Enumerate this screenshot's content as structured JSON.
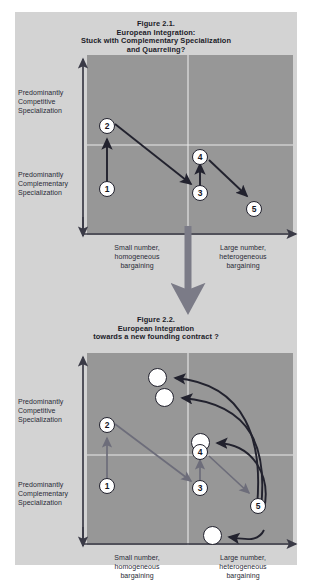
{
  "page": {
    "background": "#ffffff",
    "card_background": "#d3d3d3",
    "plot_background": "#979797",
    "ink_color": "#22222e",
    "muted_arrow_color": "#6d6d7a",
    "node_fill": "#ffffff",
    "divider_color": "#e8e8e8"
  },
  "figure1": {
    "title": {
      "line1": "Figure 2.1.",
      "line2": "European Integration:",
      "line3": "Stuck with Complementary Specialization",
      "line4": "and Quarreling?"
    },
    "y_axis": {
      "upper": {
        "line1": "Predominantly",
        "line2": "Competitive",
        "line3": "Specialization"
      },
      "lower": {
        "line1": "Predominantly",
        "line2": "Complementary",
        "line3": "Specialization"
      }
    },
    "x_axis": {
      "left": {
        "line1": "Small number,",
        "line2": "homogeneous",
        "line3": "bargaining"
      },
      "right": {
        "line1": "Large number,",
        "line2": "heterogeneous",
        "line3": "bargaining"
      }
    },
    "nodes": [
      {
        "label": "1",
        "x": 107,
        "y": 192
      },
      {
        "label": "2",
        "x": 107,
        "y": 129
      },
      {
        "label": "3",
        "x": 200,
        "y": 196
      },
      {
        "label": "4",
        "x": 200,
        "y": 160
      },
      {
        "label": "5",
        "x": 254,
        "y": 212
      }
    ],
    "arrows": [
      {
        "from": "1",
        "to": "2"
      },
      {
        "from": "2",
        "to": "3"
      },
      {
        "from": "3",
        "to": "4"
      },
      {
        "from": "4",
        "to": "5"
      }
    ]
  },
  "connector": {
    "name": "down-arrow",
    "color": "#7b7b87"
  },
  "figure2": {
    "title": {
      "line1": "Figure 2.2.",
      "line2": "European Integration",
      "line3": "towards a new founding contract ?"
    },
    "y_axis": {
      "upper": {
        "line1": "Predominantly",
        "line2": "Competitive",
        "line3": "Specialization"
      },
      "lower": {
        "line1": "Predominantly",
        "line2": "Complementary",
        "line3": "Specialization"
      }
    },
    "x_axis": {
      "left": {
        "line1": "Small number,",
        "line2": "homogeneous",
        "line3": "bargaining"
      },
      "right": {
        "line1": "Large number,",
        "line2": "heterogeneous",
        "line3": "bargaining"
      }
    },
    "nodes": [
      {
        "label": "1",
        "x": 107,
        "y": 489
      },
      {
        "label": "2",
        "x": 107,
        "y": 428
      },
      {
        "label": "3",
        "x": 200,
        "y": 491
      },
      {
        "label": "4",
        "x": 200,
        "y": 455
      },
      {
        "label": "5",
        "x": 258,
        "y": 509
      }
    ],
    "blank_nodes": [
      {
        "name": "outcome-circle-1",
        "x": 143,
        "y": 366,
        "r": 9.5
      },
      {
        "name": "outcome-circle-2",
        "x": 150,
        "y": 386,
        "r": 9.5
      },
      {
        "name": "outcome-circle-3",
        "x": 186,
        "y": 431,
        "r": 9.5
      },
      {
        "name": "outcome-circle-4",
        "x": 198,
        "y": 524,
        "r": 9.5
      }
    ],
    "arrows": [
      {
        "from": "1",
        "to": "2"
      },
      {
        "from": "2",
        "to": "3"
      },
      {
        "from": "3",
        "to": "4"
      },
      {
        "from": "4",
        "to": "5"
      },
      {
        "from": "5",
        "to": "outcome-circle-1",
        "style": "curved"
      },
      {
        "from": "5",
        "to": "outcome-circle-2",
        "style": "curved"
      },
      {
        "from": "5",
        "to": "outcome-circle-3",
        "style": "curved"
      },
      {
        "from": "5",
        "to": "outcome-circle-4",
        "style": "curved"
      }
    ]
  }
}
